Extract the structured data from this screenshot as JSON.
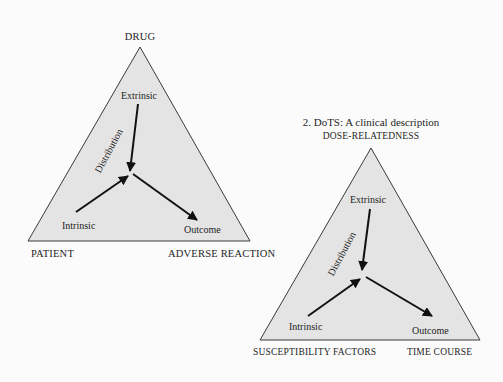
{
  "colors": {
    "background": "#fbfbfb",
    "triangle_fill": "#e4e4e4",
    "stroke": "#3a3a3a",
    "arrow": "#111111",
    "text": "#1e1e1e"
  },
  "diagram1": {
    "vertices": {
      "top": "DRUG",
      "bottom_left": "PATIENT",
      "bottom_right": "ADVERSE REACTION"
    },
    "nodes": {
      "extrinsic": "Extrinsic",
      "intrinsic": "Intrinsic",
      "outcome": "Outcome",
      "distribution": "Distribution"
    }
  },
  "diagram2": {
    "caption": "2. DoTS: A clinical description",
    "vertices": {
      "top": "DOSE-RELATEDNESS",
      "bottom_left": "SUSCEPTIBILITY FACTORS",
      "bottom_right": "TIME COURSE"
    },
    "nodes": {
      "extrinsic": "Extrinsic",
      "intrinsic": "Intrinsic",
      "outcome": "Outcome",
      "distribution": "Distribution"
    }
  }
}
